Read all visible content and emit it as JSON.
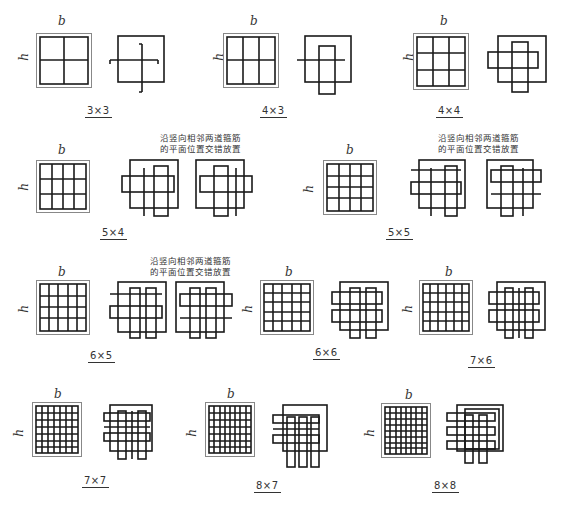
{
  "figure": {
    "dimension_labels": {
      "width": "b",
      "height": "h"
    },
    "stagger_note_line1": "沿竖向相邻两道箍筋",
    "stagger_note_line2": "的平面位置交错放置",
    "panels": [
      {
        "id": "3x3",
        "caption": "3×3",
        "nx": 3,
        "ny": 3,
        "staggered": false
      },
      {
        "id": "4x3",
        "caption": "4×3",
        "nx": 4,
        "ny": 3,
        "staggered": false
      },
      {
        "id": "4x4",
        "caption": "4×4",
        "nx": 4,
        "ny": 4,
        "staggered": false
      },
      {
        "id": "5x4",
        "caption": "5×4",
        "nx": 5,
        "ny": 4,
        "staggered": true
      },
      {
        "id": "5x5",
        "caption": "5×5",
        "nx": 5,
        "ny": 5,
        "staggered": true
      },
      {
        "id": "6x5",
        "caption": "6×5",
        "nx": 6,
        "ny": 5,
        "staggered": true
      },
      {
        "id": "6x6",
        "caption": "6×6",
        "nx": 6,
        "ny": 6,
        "staggered": false
      },
      {
        "id": "7x6",
        "caption": "7×6",
        "nx": 7,
        "ny": 6,
        "staggered": false
      },
      {
        "id": "7x7",
        "caption": "7×7",
        "nx": 7,
        "ny": 7,
        "staggered": false
      },
      {
        "id": "8x7",
        "caption": "8×7",
        "nx": 8,
        "ny": 7,
        "staggered": false
      },
      {
        "id": "8x8",
        "caption": "8×8",
        "nx": 8,
        "ny": 8,
        "staggered": false
      }
    ]
  }
}
